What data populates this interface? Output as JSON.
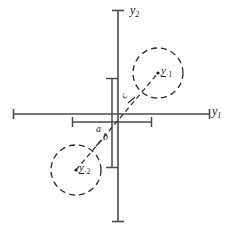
{
  "figure": {
    "type": "scatter-diagram",
    "title": "",
    "background_color": "#ffffff",
    "stroke_color": "#4a4a4a",
    "text_color": "#1a1a1a"
  },
  "axes": {
    "x_axis": {
      "label_text": "y",
      "label_sub": "1",
      "name": "y1",
      "orientation": "horizontal",
      "x_start": 13,
      "x_end": 210,
      "y": 114,
      "has_end_ticks": true
    },
    "y_axis": {
      "label_text": "y",
      "label_sub": "2",
      "name": "y2",
      "orientation": "vertical",
      "y_start": 10,
      "y_end": 222,
      "x": 118,
      "has_end_ticks": true
    },
    "origin": {
      "x": 118,
      "y": 114
    }
  },
  "groups": [
    {
      "id": "group-1",
      "label_text": "y",
      "label_sub": "·1",
      "underlined": true,
      "center": {
        "x": 158,
        "y": 73
      },
      "radius": 25,
      "quadrant": "upper-right",
      "style": "dashed-circle"
    },
    {
      "id": "group-2",
      "label_text": "y",
      "label_sub": "·2",
      "underlined": true,
      "center": {
        "x": 76,
        "y": 170
      },
      "radius": 25,
      "quadrant": "lower-left",
      "style": "dashed-circle"
    }
  ],
  "connector": {
    "name": "mean-connector-line",
    "style": "dashed",
    "from": {
      "x": 76,
      "y": 170
    },
    "to": {
      "x": 158,
      "y": 73
    }
  },
  "dimensions": [
    {
      "id": "dim-a",
      "label": "a",
      "orientation": "horizontal",
      "description": "horizontal separation between group means",
      "bar_x_start": 72,
      "bar_x_end": 152,
      "bar_y": 122,
      "label_x": 96,
      "label_y": 124
    },
    {
      "id": "dim-b",
      "label": "b",
      "orientation": "vertical",
      "description": "vertical separation between group means",
      "bar_y_start": 78,
      "bar_y_end": 168,
      "bar_x": 112,
      "label_x": 103,
      "label_y": 132
    },
    {
      "id": "dim-c",
      "label": "c",
      "orientation": "diagonal",
      "description": "distance along connector between group means",
      "label_x": 122,
      "label_y": 91
    }
  ]
}
